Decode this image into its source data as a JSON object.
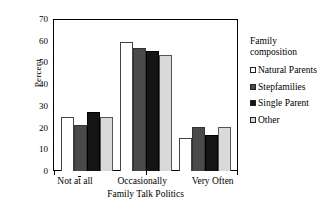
{
  "chart_data": {
    "type": "bar",
    "title": "",
    "xlabel": "Family Talk Politics",
    "ylabel": "Percent",
    "categories": [
      "Not at all",
      "Occasionally",
      "Very Often"
    ],
    "series": [
      {
        "name": "Natural Parents",
        "values": [
          25,
          59.5,
          15
        ],
        "color": "#ffffff"
      },
      {
        "name": "Stepfamilies",
        "values": [
          21,
          56.5,
          20.5
        ],
        "color": "#4a4a4a"
      },
      {
        "name": "Single Parent",
        "values": [
          27,
          55.5,
          16.5
        ],
        "color": "#141414"
      },
      {
        "name": "Other",
        "values": [
          25,
          53.5,
          20.5
        ],
        "color": "#d9d9d9"
      }
    ],
    "ylim": [
      0,
      70
    ],
    "yticks": [
      0,
      10,
      20,
      30,
      40,
      50,
      60,
      70
    ],
    "ytick_labels": [
      "0",
      "10",
      "20",
      "30",
      "40",
      "50",
      "60",
      "70"
    ],
    "grid": false,
    "legend_title": "Family composition",
    "legend_position": "right"
  },
  "legend": {
    "title_line1": "Family",
    "title_line2": "composition",
    "entries": [
      {
        "label": "Natural Parents"
      },
      {
        "label": "Stepfamilies"
      },
      {
        "label": "Single Parent"
      },
      {
        "label": "Other"
      }
    ]
  }
}
